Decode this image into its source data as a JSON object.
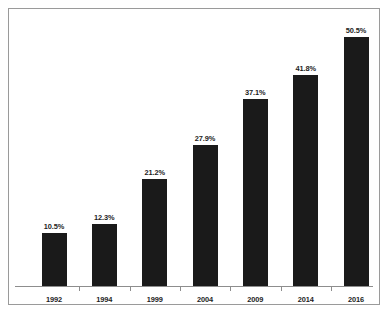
{
  "chart_data": {
    "type": "bar",
    "title": "",
    "subtitle": "",
    "xlabel": "",
    "ylabel": "",
    "categories": [
      "1992",
      "1994",
      "1999",
      "2004",
      "2009",
      "2014",
      "2016"
    ],
    "values": [
      10.5,
      12.3,
      21.2,
      27.9,
      37.1,
      41.8,
      50.5
    ],
    "value_labels": [
      "10.5%",
      "12.3%",
      "21.2%",
      "27.9%",
      "37.1%",
      "41.8%",
      "50.5%"
    ],
    "ylim": [
      0,
      54
    ],
    "grid": false,
    "legend": false,
    "legend_position": "none",
    "series": [
      {
        "name": "",
        "values": [
          10.5,
          12.3,
          21.2,
          27.9,
          37.1,
          41.8,
          50.5
        ]
      }
    ],
    "colors": {
      "bar": "#1a1a1a",
      "background": "#ffffff",
      "frame": "#9a9a9a",
      "axis": "#8d8d8d",
      "text": "#1d1d1d"
    }
  },
  "figure": {
    "caption_sliver": ""
  }
}
